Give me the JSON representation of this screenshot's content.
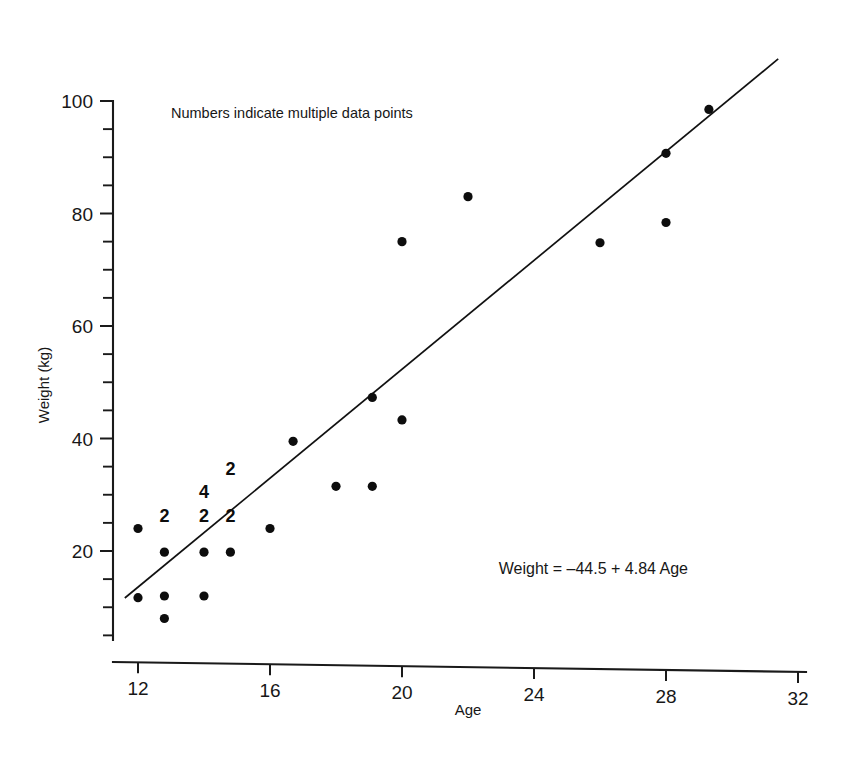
{
  "chart_data": {
    "type": "scatter",
    "title": "",
    "xlabel": "Age",
    "ylabel": "Weight (kg)",
    "xlim": [
      11.4,
      32
    ],
    "ylim": [
      0,
      104
    ],
    "xticks": [
      12,
      16,
      20,
      24,
      28,
      32
    ],
    "yticks": [
      20,
      40,
      60,
      80,
      100
    ],
    "x_minor_step": 1,
    "y_minor_step": 5,
    "grid": false,
    "legend": null,
    "annotations": [
      {
        "name": "multiple-points-note",
        "text": "Numbers indicate multiple data points",
        "x": 13.0,
        "y": 97.0
      },
      {
        "name": "regression-equation",
        "text": "Weight = –44.5 + 4.84 Age",
        "x": 25.8,
        "y": 16.0
      }
    ],
    "fit_line": {
      "name": "least-squares-regression",
      "equation": "Weight = -44.5 + 4.84 Age",
      "intercept": -44.5,
      "slope": 4.84,
      "x_start": 11.6,
      "x_end": 31.4
    },
    "points": [
      {
        "x": 12.0,
        "y": 24.0,
        "n": 1
      },
      {
        "x": 12.0,
        "y": 11.7,
        "n": 1
      },
      {
        "x": 12.8,
        "y": 19.8,
        "n": 2
      },
      {
        "x": 12.8,
        "y": 12.0,
        "n": 1
      },
      {
        "x": 12.8,
        "y": 8.0,
        "n": 1
      },
      {
        "x": 14.0,
        "y": 19.8,
        "n": 2
      },
      {
        "x": 14.0,
        "y": 12.0,
        "n": 1
      },
      {
        "x": 14.8,
        "y": 19.8,
        "n": 2
      },
      {
        "x": 16.0,
        "y": 24.0,
        "n": 1
      },
      {
        "x": 16.7,
        "y": 39.5,
        "n": 1
      },
      {
        "x": 18.0,
        "y": 31.5,
        "n": 1
      },
      {
        "x": 19.1,
        "y": 31.5,
        "n": 1
      },
      {
        "x": 19.1,
        "y": 47.3,
        "n": 1
      },
      {
        "x": 20.0,
        "y": 43.3,
        "n": 1
      },
      {
        "x": 20.0,
        "y": 75.0,
        "n": 1
      },
      {
        "x": 22.0,
        "y": 83.0,
        "n": 1
      },
      {
        "x": 26.0,
        "y": 74.8,
        "n": 1
      },
      {
        "x": 28.0,
        "y": 78.4,
        "n": 1
      },
      {
        "x": 28.0,
        "y": 90.7,
        "n": 1
      },
      {
        "x": 29.3,
        "y": 98.5,
        "n": 1
      }
    ],
    "multiplicity_labels": [
      {
        "text": "2",
        "x": 12.8,
        "y": 25.2
      },
      {
        "text": "2",
        "x": 14.0,
        "y": 25.2
      },
      {
        "text": "4",
        "x": 14.0,
        "y": 29.5
      },
      {
        "text": "2",
        "x": 14.8,
        "y": 25.2
      },
      {
        "text": "2",
        "x": 14.8,
        "y": 33.5
      }
    ]
  },
  "axes": {
    "x_tick_labels": [
      "12",
      "16",
      "20",
      "24",
      "28",
      "32"
    ],
    "y_tick_labels": [
      "20",
      "40",
      "60",
      "80",
      "100"
    ],
    "x_title": "Age",
    "y_title": "Weight (kg)"
  },
  "notes": {
    "multiple_points": "Numbers indicate multiple data points",
    "equation": "Weight = –44.5 + 4.84 Age"
  },
  "colors": {
    "ink": "#171717",
    "dot": "#0d0d0d",
    "background": "#ffffff"
  }
}
